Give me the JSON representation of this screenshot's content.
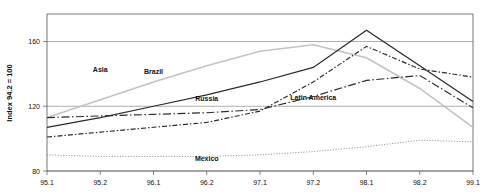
{
  "chart_data": {
    "type": "line",
    "title": "",
    "xlabel": "",
    "ylabel": "Index 94.2 = 100",
    "x": [
      "95.1",
      "95.2",
      "96.1",
      "96.2",
      "97.1",
      "97.2",
      "98.1",
      "98.2",
      "99.1"
    ],
    "xtick_labels": [
      "95.1",
      "95.2",
      "96.1",
      "96.2",
      "97.1",
      "97.2",
      "98.1",
      "98.2",
      "99.1"
    ],
    "ytick_labels": [
      "80",
      "120",
      "160"
    ],
    "yticks": [
      80,
      120,
      160
    ],
    "ylim": [
      80,
      177
    ],
    "xlim": [
      "95.1",
      "99.1"
    ],
    "grid": "horizontal",
    "legend": "inline-annotations",
    "series": [
      {
        "name": "Asia",
        "style": "solid-light",
        "color": "#c3c3c3",
        "values": [
          113,
          124,
          135,
          145,
          154,
          158,
          150,
          131,
          107
        ],
        "label_x": "95.2",
        "label_y": 141
      },
      {
        "name": "Brazil",
        "style": "solid",
        "color": "#2a2a2a",
        "values": [
          107,
          113,
          120,
          127,
          135,
          144,
          167,
          145,
          123
        ],
        "label_x": "96.1",
        "label_y": 140
      },
      {
        "name": "Russia",
        "style": "dash-dot",
        "color": "#2a2a2a",
        "values": [
          101,
          104,
          107,
          110,
          117,
          135,
          157,
          143,
          138
        ],
        "label_x": "96.2",
        "label_y": 123
      },
      {
        "name": "Latin America",
        "style": "long-dash-dot",
        "color": "#2a2a2a",
        "values": [
          113,
          114,
          115,
          116,
          118,
          126,
          136,
          139,
          119
        ],
        "label_x": "97.2",
        "label_y": 124
      },
      {
        "name": "Mexico",
        "style": "dotted",
        "color": "#8d8d8d",
        "values": [
          90,
          89,
          89,
          89,
          90,
          92,
          95,
          99,
          98
        ],
        "label_x": "96.2",
        "label_y": 86
      }
    ]
  }
}
